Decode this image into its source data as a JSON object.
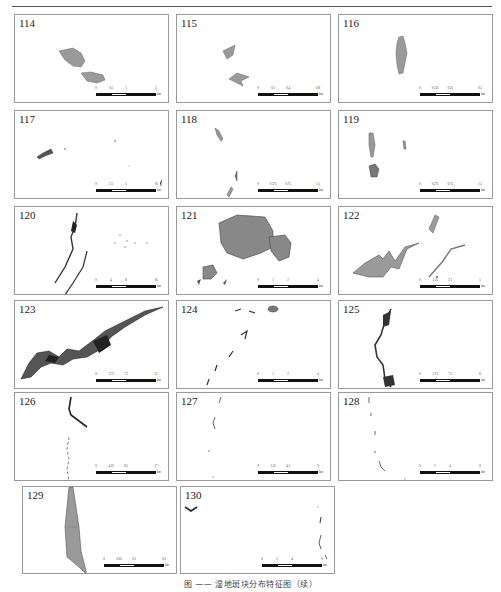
{
  "page": {
    "caption": "图 —— 湿地斑块分布特征图（续）"
  },
  "panels": [
    {
      "id": "114",
      "scale": [
        "0",
        "0.5",
        "1",
        "2"
      ],
      "unit": "km"
    },
    {
      "id": "115",
      "scale": [
        "0",
        "0.2",
        "0.4",
        "0.8"
      ],
      "unit": "km"
    },
    {
      "id": "116",
      "scale": [
        "0",
        "0.125",
        "0.25",
        "0.5"
      ],
      "unit": "km"
    },
    {
      "id": "117",
      "scale": [
        "0",
        "2.5",
        "5",
        "10"
      ],
      "unit": "km"
    },
    {
      "id": "118",
      "scale": [
        "0",
        "0.375",
        "0.75",
        "1.5"
      ],
      "unit": "km"
    },
    {
      "id": "119",
      "scale": [
        "0",
        "0.375",
        "0.75",
        "1.5"
      ],
      "unit": "km"
    },
    {
      "id": "120",
      "scale": [
        "0",
        "4",
        "8",
        "16"
      ],
      "unit": "km"
    },
    {
      "id": "121",
      "scale": [
        "0",
        "1",
        "2",
        "4"
      ],
      "unit": "km"
    },
    {
      "id": "122",
      "scale": [
        "0",
        "1.25",
        "2.5",
        "5"
      ],
      "unit": "km"
    },
    {
      "id": "123",
      "scale": [
        "0",
        "3.75",
        "7.5",
        "15"
      ],
      "unit": "km"
    },
    {
      "id": "124",
      "scale": [
        "0",
        "1",
        "2",
        "4"
      ],
      "unit": "km"
    },
    {
      "id": "125",
      "scale": [
        "0",
        "3.75",
        "7.5",
        "15"
      ],
      "unit": "km"
    },
    {
      "id": "126",
      "scale": [
        "0",
        "4.25",
        "8.5",
        "17"
      ],
      "unit": "km"
    },
    {
      "id": "127",
      "scale": [
        "0",
        "2.25",
        "4.5",
        "9"
      ],
      "unit": "km"
    },
    {
      "id": "128",
      "scale": [
        "0",
        "2",
        "4",
        "8"
      ],
      "unit": "km"
    },
    {
      "id": "129",
      "scale": [
        "0",
        "0.05",
        "0.1",
        "0.2"
      ],
      "unit": "km"
    },
    {
      "id": "130",
      "scale": [
        "0",
        "2",
        "4",
        "8"
      ],
      "unit": "km"
    }
  ],
  "colors": {
    "patch_fill": "#9a9a9a",
    "patch_dark": "#3a3a3a",
    "frame": "#9a9a9a"
  }
}
